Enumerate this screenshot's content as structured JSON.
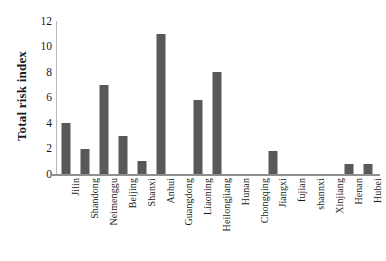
{
  "chart_data": {
    "type": "bar",
    "title": "",
    "xlabel": "",
    "ylabel": "Total risk index",
    "ylim": [
      0,
      12
    ],
    "ytick_labels": [
      "12",
      "10",
      "8",
      "6",
      "4",
      "2",
      "0"
    ],
    "yticks": [
      12,
      10,
      8,
      6,
      4,
      2,
      0
    ],
    "grid": false,
    "legend": false,
    "bar_color": "#595959",
    "categories": [
      "Jilin",
      "Shandong",
      "Neimenggu",
      "Beijing",
      "Shanxi",
      "Anhui",
      "Guangdong",
      "Liaoning",
      "Heilongjiang",
      "Hunan",
      "Chongqing",
      "Jiangxi",
      "fujian",
      "shannxi",
      "Xinjiang",
      "Henan",
      "Hubei"
    ],
    "values": [
      4.0,
      2.0,
      7.0,
      3.0,
      1.0,
      11.0,
      0,
      5.8,
      8.0,
      0,
      0,
      1.8,
      0,
      0,
      0,
      0.8,
      0.8
    ]
  }
}
